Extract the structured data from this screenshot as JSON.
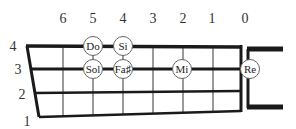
{
  "diagram": {
    "type": "fretboard",
    "colors": {
      "string": "#1a1a1a",
      "fret": "#9a9a9a",
      "circle_fill": "#ffffff",
      "circle_stroke": "#666666",
      "text": "#333333"
    },
    "fret_numbers": [
      {
        "label": "6",
        "x": 63
      },
      {
        "label": "5",
        "x": 93
      },
      {
        "label": "4",
        "x": 123
      },
      {
        "label": "3",
        "x": 153
      },
      {
        "label": "2",
        "x": 183
      },
      {
        "label": "1",
        "x": 212
      },
      {
        "label": "0",
        "x": 245
      }
    ],
    "string_numbers": [
      {
        "label": "4",
        "x": 13,
        "y": 50
      },
      {
        "label": "3",
        "x": 18,
        "y": 73
      },
      {
        "label": "2",
        "x": 22,
        "y": 97
      },
      {
        "label": "1",
        "x": 26,
        "y": 123
      }
    ],
    "notes": [
      {
        "label": "Do",
        "string": 4,
        "fret": 5
      },
      {
        "label": "Si",
        "string": 4,
        "fret": 4
      },
      {
        "label": "Sol",
        "string": 3,
        "fret": 5
      },
      {
        "label": "Fa♯",
        "string": 3,
        "fret": 4
      },
      {
        "label": "Mi",
        "string": 3,
        "fret": 2
      },
      {
        "label": "Re",
        "string": 3,
        "fret": 0
      }
    ]
  }
}
